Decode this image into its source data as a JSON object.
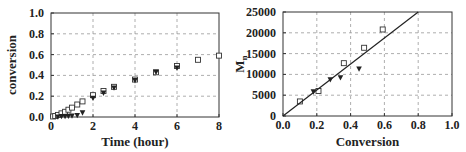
{
  "chart_data": [
    {
      "type": "scatter",
      "title": "",
      "xlabel": "Time (hour)",
      "ylabel": "conversion",
      "xlim": [
        0,
        8
      ],
      "ylim": [
        0,
        1.0
      ],
      "xticks": [
        "0",
        "2",
        "4",
        "6",
        "8"
      ],
      "yticks": [
        "0.0",
        "0.2",
        "0.4",
        "0.6",
        "0.8",
        "1.0"
      ],
      "grid": true,
      "legend": null,
      "series": [
        {
          "name": "open-square",
          "marker": "square-open",
          "x": [
            0.1,
            0.2,
            0.33,
            0.5,
            0.67,
            0.83,
            1.0,
            1.25,
            1.5,
            2,
            2.5,
            3,
            4,
            5,
            6,
            7,
            8
          ],
          "y": [
            0.005,
            0.01,
            0.02,
            0.035,
            0.05,
            0.07,
            0.09,
            0.12,
            0.15,
            0.21,
            0.25,
            0.29,
            0.36,
            0.43,
            0.49,
            0.55,
            0.59
          ]
        },
        {
          "name": "filled-triangle",
          "marker": "triangle-down-filled",
          "x": [
            0.33,
            0.5,
            0.67,
            0.83,
            1.0,
            1.25,
            1.5,
            2,
            2.5,
            3,
            4,
            5,
            6
          ],
          "y": [
            0.0,
            0.005,
            0.005,
            0.008,
            0.01,
            0.015,
            0.04,
            0.18,
            0.23,
            0.28,
            0.35,
            0.43,
            0.47
          ]
        }
      ]
    },
    {
      "type": "scatter",
      "title": "",
      "xlabel": "Conversion",
      "ylabel": "Mn",
      "xlim": [
        0,
        1.0
      ],
      "ylim": [
        0,
        25000
      ],
      "xticks": [
        "0.0",
        "0.2",
        "0.4",
        "0.6",
        "0.8",
        "1.0"
      ],
      "yticks": [
        "0",
        "5000",
        "10000",
        "15000",
        "20000",
        "25000"
      ],
      "grid": true,
      "legend": null,
      "series": [
        {
          "name": "open-square",
          "marker": "square-open",
          "x": [
            0.1,
            0.21,
            0.36,
            0.48,
            0.59
          ],
          "y": [
            3500,
            6000,
            12700,
            16400,
            20800
          ]
        },
        {
          "name": "filled-triangle",
          "marker": "triangle-down-filled",
          "x": [
            0.18,
            0.28,
            0.34,
            0.45
          ],
          "y": [
            5800,
            8700,
            9200,
            11300
          ]
        },
        {
          "name": "theoretical-line",
          "marker": "line",
          "x": [
            0,
            0.8
          ],
          "y": [
            0,
            25000
          ]
        }
      ]
    }
  ]
}
